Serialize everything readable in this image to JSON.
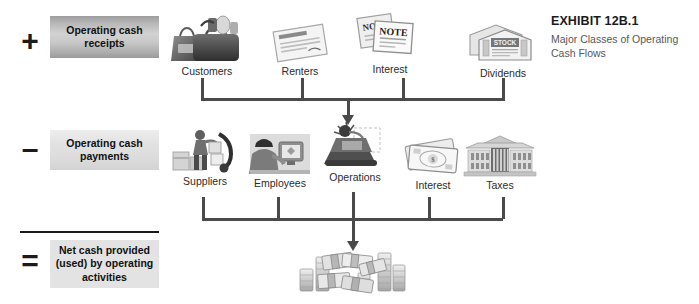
{
  "exhibit": {
    "title": "EXHIBIT 12B.1",
    "subtitle": "Major Classes of Operating Cash Flows"
  },
  "operators": {
    "plus": "+",
    "minus": "–",
    "equals": "="
  },
  "captions": {
    "receipts": "Operating cash receipts",
    "payments": "Operating cash payments",
    "net": "Net cash provided (used) by operating activities"
  },
  "rows": [
    {
      "id": "receipts",
      "nodes": [
        {
          "label": "Customers",
          "icon": "shopping-bags-icon"
        },
        {
          "label": "Renters",
          "icon": "rental-agreement-icon"
        },
        {
          "label": "Interest",
          "icon": "promissory-notes-icon"
        },
        {
          "label": "Dividends",
          "icon": "stock-certificates-icon"
        }
      ]
    },
    {
      "id": "payments",
      "nodes": [
        {
          "label": "Suppliers",
          "icon": "delivery-worker-icon"
        },
        {
          "label": "Employees",
          "icon": "office-worker-icon"
        },
        {
          "label": "Operations",
          "icon": "machinery-icon"
        },
        {
          "label": "Interest",
          "icon": "banknotes-icon"
        },
        {
          "label": "Taxes",
          "icon": "government-building-icon"
        }
      ]
    }
  ],
  "result": {
    "icon": "cash-stacks-icon"
  },
  "colors": {
    "line": "#4a4a4a",
    "rule": "#1b1b1b",
    "caption_text": "#111111",
    "label_text": "#2b2b2b",
    "exhibit_subtitle": "#57585a",
    "box_net": "#e3e3e3"
  }
}
